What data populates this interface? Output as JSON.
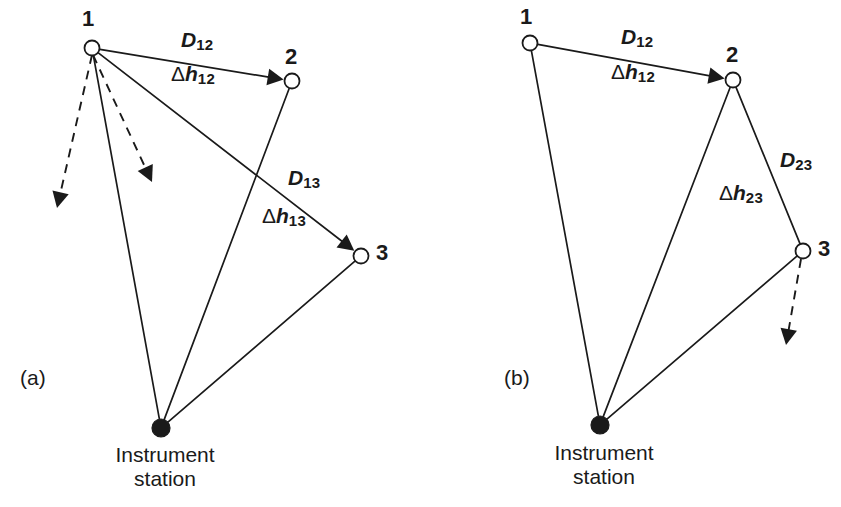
{
  "figure": {
    "background_color": "#ffffff",
    "ink_color": "#1a1a1a",
    "width": 841,
    "height": 507
  },
  "panels": [
    {
      "id": "a",
      "caption": "(a)",
      "caption_pos": {
        "x": 20,
        "y": 366
      },
      "station": {
        "label_line1": "Instrument",
        "label_line2": "station",
        "x": 161,
        "y": 428,
        "radius": 9,
        "caption_x": 165,
        "caption_y": 443
      },
      "nodes": [
        {
          "name": "1",
          "x": 92,
          "y": 48,
          "radius": 7.5,
          "label_x": 82,
          "label_y": 6
        },
        {
          "name": "2",
          "x": 292,
          "y": 81,
          "radius": 7.5,
          "label_x": 285,
          "label_y": 44
        },
        {
          "name": "3",
          "x": 361,
          "y": 256,
          "radius": 7.5,
          "label_x": 376,
          "label_y": 240
        }
      ],
      "measures": [
        {
          "name": "D12",
          "base": "D",
          "sub": "12",
          "delta": false,
          "x": 181,
          "y": 28
        },
        {
          "name": "dh12",
          "base": "h",
          "sub": "12",
          "delta": true,
          "x": 171,
          "y": 62
        },
        {
          "name": "D13",
          "base": "D",
          "sub": "13",
          "delta": false,
          "x": 288,
          "y": 166
        },
        {
          "name": "dh13",
          "base": "h",
          "sub": "13",
          "delta": true,
          "x": 262,
          "y": 204
        }
      ],
      "solid_edges": [
        {
          "from": "node1",
          "to": "node2",
          "arrow": true
        },
        {
          "from": "node1",
          "to": "node3",
          "arrow": true
        },
        {
          "from": "node1",
          "to": "station",
          "arrow": false
        },
        {
          "from": "node2",
          "to": "station",
          "arrow": false
        },
        {
          "from": "node3",
          "to": "station",
          "arrow": false
        }
      ],
      "dashed_arrows": [
        {
          "name": "sight-ray-left",
          "x1": 92,
          "y1": 55,
          "x2": 57,
          "y2": 208
        },
        {
          "name": "sight-ray-right",
          "x1": 93,
          "y1": 55,
          "x2": 152,
          "y2": 182
        }
      ]
    },
    {
      "id": "b",
      "caption": "(b)",
      "caption_pos": {
        "x": 504,
        "y": 366
      },
      "station": {
        "label_line1": "Instrument",
        "label_line2": "station",
        "x": 600,
        "y": 425,
        "radius": 9,
        "caption_x": 604,
        "caption_y": 441
      },
      "nodes": [
        {
          "name": "1",
          "x": 530,
          "y": 43,
          "radius": 7.5,
          "label_x": 520,
          "label_y": 4
        },
        {
          "name": "2",
          "x": 733,
          "y": 80,
          "radius": 7.5,
          "label_x": 726,
          "label_y": 42
        },
        {
          "name": "3",
          "x": 803,
          "y": 251,
          "radius": 7.5,
          "label_x": 818,
          "label_y": 236
        }
      ],
      "measures": [
        {
          "name": "D12",
          "base": "D",
          "sub": "12",
          "delta": false,
          "x": 621,
          "y": 25
        },
        {
          "name": "dh12",
          "base": "h",
          "sub": "12",
          "delta": true,
          "x": 611,
          "y": 60
        },
        {
          "name": "D23",
          "base": "D",
          "sub": "23",
          "delta": false,
          "x": 780,
          "y": 148
        },
        {
          "name": "dh23",
          "base": "h",
          "sub": "23",
          "delta": true,
          "x": 719,
          "y": 181
        }
      ],
      "solid_edges": [
        {
          "from": "node1",
          "to": "node2",
          "arrow": true
        },
        {
          "from": "node2",
          "to": "node3",
          "arrow": false
        },
        {
          "from": "node1",
          "to": "station",
          "arrow": false
        },
        {
          "from": "node2",
          "to": "station",
          "arrow": false
        },
        {
          "from": "node3",
          "to": "station",
          "arrow": false
        }
      ],
      "dashed_arrows": [
        {
          "name": "sight-ray-down",
          "x1": 801,
          "y1": 259,
          "x2": 786,
          "y2": 345
        }
      ]
    }
  ],
  "symbols": {
    "delta": "Δ"
  }
}
